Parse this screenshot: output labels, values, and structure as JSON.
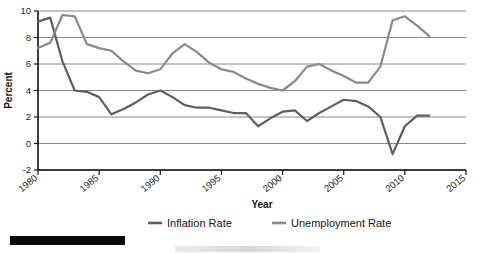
{
  "chart_data": {
    "type": "line",
    "title": "",
    "xlabel": "Year",
    "ylabel": "Percent",
    "xlim": [
      1980,
      2015
    ],
    "ylim": [
      -2,
      10
    ],
    "xticks": [
      1980,
      1985,
      1990,
      1995,
      2000,
      2005,
      2010,
      2015
    ],
    "xtick_labels": [
      "1980",
      "1985",
      "1990",
      "1995",
      "2000",
      "2005",
      "2010",
      "2015"
    ],
    "yticks": [
      -2,
      0,
      2,
      4,
      6,
      8,
      10
    ],
    "ytick_labels": [
      "-2",
      "0",
      "2",
      "4",
      "6",
      "8",
      "10"
    ],
    "grid": true,
    "grid_axis": "y",
    "legend_position": "bottom",
    "x": [
      1980,
      1981,
      1982,
      1983,
      1984,
      1985,
      1986,
      1987,
      1988,
      1989,
      1990,
      1991,
      1992,
      1993,
      1994,
      1995,
      1996,
      1997,
      1998,
      1999,
      2000,
      2001,
      2002,
      2003,
      2004,
      2005,
      2006,
      2007,
      2008,
      2009,
      2010,
      2011,
      2012
    ],
    "series": [
      {
        "name": "Inflation Rate",
        "color": "#5f5f5f",
        "values": [
          9.2,
          9.5,
          6.2,
          4.0,
          3.9,
          3.5,
          2.2,
          2.6,
          3.1,
          3.7,
          4.0,
          3.5,
          2.9,
          2.7,
          2.7,
          2.5,
          2.3,
          2.3,
          1.3,
          1.9,
          2.4,
          2.5,
          1.7,
          2.3,
          2.8,
          3.3,
          3.2,
          2.8,
          2.0,
          -0.8,
          1.3,
          2.1,
          2.1
        ]
      },
      {
        "name": "Unemployment Rate",
        "color": "#8a8a8a",
        "values": [
          7.2,
          7.6,
          9.7,
          9.6,
          7.5,
          7.2,
          7.0,
          6.2,
          5.5,
          5.3,
          5.6,
          6.8,
          7.5,
          6.9,
          6.1,
          5.6,
          5.4,
          4.9,
          4.5,
          4.2,
          4.0,
          4.7,
          5.8,
          6.0,
          5.5,
          5.1,
          4.6,
          4.6,
          5.8,
          9.3,
          9.6,
          8.9,
          8.1
        ]
      }
    ]
  },
  "legend": {
    "items": [
      {
        "label": "Inflation Rate",
        "color": "#5f5f5f"
      },
      {
        "label": "Unemployment Rate",
        "color": "#8a8a8a"
      }
    ]
  },
  "axes": {
    "y_title": "Percent",
    "x_title": "Year"
  }
}
